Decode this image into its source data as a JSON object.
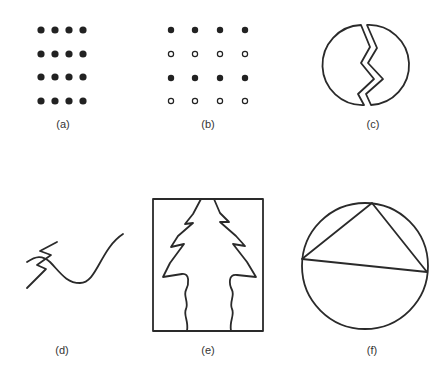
{
  "figure": {
    "panels": [
      {
        "id": "a",
        "label": "(a)",
        "description": "4x4 grid of filled dots, closely spaced columns",
        "grid": [
          [
            "filled",
            "filled",
            "filled",
            "filled"
          ],
          [
            "filled",
            "filled",
            "filled",
            "filled"
          ],
          [
            "filled",
            "filled",
            "filled",
            "filled"
          ],
          [
            "filled",
            "filled",
            "filled",
            "filled"
          ]
        ]
      },
      {
        "id": "b",
        "label": "(b)",
        "description": "4x4 grid alternating rows of filled and open dots",
        "grid": [
          [
            "filled",
            "filled",
            "filled",
            "filled"
          ],
          [
            "open",
            "open",
            "open",
            "open"
          ],
          [
            "filled",
            "filled",
            "filled",
            "filled"
          ],
          [
            "open",
            "open",
            "open",
            "open"
          ]
        ]
      },
      {
        "id": "c",
        "label": "(c)",
        "description": "circle split by a zigzag crack"
      },
      {
        "id": "d",
        "label": "(d)",
        "description": "zigzag line crossing a smooth curve"
      },
      {
        "id": "e",
        "label": "(e)",
        "description": "rectangle containing a tree silhouette with wavy trunk"
      },
      {
        "id": "f",
        "label": "(f)",
        "description": "triangle inscribed in a circle"
      }
    ]
  }
}
